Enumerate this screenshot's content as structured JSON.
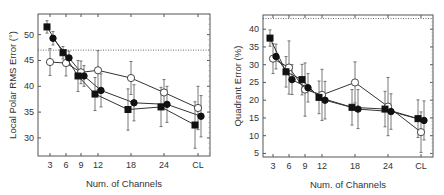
{
  "chart_data": [
    {
      "type": "line",
      "title": "",
      "xlabel": "Num. of Channels",
      "ylabel": "Local Polar RMS Error (°)",
      "categories": [
        "3",
        "6",
        "9",
        "12",
        "18",
        "24",
        "CL"
      ],
      "ylim": [
        26.5,
        54
      ],
      "yticks": [
        30,
        35,
        40,
        45,
        50
      ],
      "grid": false,
      "legend": null,
      "reference_line": {
        "y": 47,
        "style": "dotted"
      },
      "series": [
        {
          "name": "filled-square",
          "marker": "square-filled",
          "values": [
            51.5,
            46.5,
            42.0,
            38.5,
            35.5,
            36.0,
            32.5
          ],
          "err": [
            1.2,
            1.2,
            3.0,
            3.2,
            4.0,
            3.8,
            4.5
          ]
        },
        {
          "name": "filled-circle",
          "marker": "circle-filled",
          "values": [
            49.3,
            45.5,
            42.0,
            39.2,
            36.8,
            36.5,
            34.2
          ],
          "err": [
            1.3,
            1.3,
            2.0,
            3.2,
            3.5,
            3.5,
            4.0
          ]
        },
        {
          "name": "open-circle",
          "marker": "circle-open",
          "values": [
            44.7,
            44.5,
            42.7,
            43.1,
            41.6,
            38.8,
            35.8
          ],
          "err": [
            2.6,
            2.5,
            2.2,
            3.8,
            3.2,
            2.5,
            4.2
          ]
        }
      ]
    },
    {
      "type": "line",
      "title": "",
      "xlabel": "Num. of Channels",
      "ylabel": "Quadrant Error (%)",
      "categories": [
        "3",
        "6",
        "9",
        "12",
        "18",
        "24",
        "CL"
      ],
      "ylim": [
        4,
        44
      ],
      "yticks": [
        5,
        10,
        15,
        20,
        25,
        30,
        35,
        40
      ],
      "grid": false,
      "legend": null,
      "reference_line": {
        "y": 43,
        "style": "dotted"
      },
      "series": [
        {
          "name": "filled-square",
          "marker": "square-filled",
          "values": [
            37.5,
            28.0,
            25.8,
            20.8,
            18.0,
            17.5,
            14.8
          ],
          "err": [
            2.3,
            4.3,
            4.3,
            4.6,
            5.0,
            5.0,
            5.3
          ]
        },
        {
          "name": "filled-circle",
          "marker": "circle-filled",
          "values": [
            32.3,
            25.8,
            23.5,
            20.0,
            17.5,
            16.8,
            14.3
          ],
          "err": [
            3.5,
            4.2,
            4.0,
            5.3,
            5.5,
            5.0,
            5.5
          ]
        },
        {
          "name": "open-circle",
          "marker": "circle-open",
          "values": [
            31.7,
            29.2,
            23.0,
            21.5,
            25.0,
            18.2,
            11.0
          ],
          "err": [
            4.2,
            7.5,
            7.5,
            7.2,
            5.8,
            8.2,
            5.7
          ]
        }
      ]
    }
  ],
  "layout": [
    {
      "frame": {
        "x0": 38,
        "y0": 14,
        "x1": 210,
        "y1": 156
      },
      "xpos": [
        50,
        66,
        81,
        98,
        131,
        164,
        198
      ],
      "offsets": {
        "filled-square": -3,
        "filled-circle": 3,
        "open-circle": 0
      }
    },
    {
      "frame": {
        "x0": 263,
        "y0": 15,
        "x1": 433,
        "y1": 157
      },
      "xpos": [
        273,
        289,
        305,
        322,
        355,
        388,
        421
      ],
      "offsets": {
        "filled-square": -3,
        "filled-circle": 3,
        "open-circle": 0
      }
    }
  ],
  "colors": {
    "line": "#333333",
    "frame": "#555555",
    "fill": "#111111",
    "open_fill": "#ffffff"
  }
}
